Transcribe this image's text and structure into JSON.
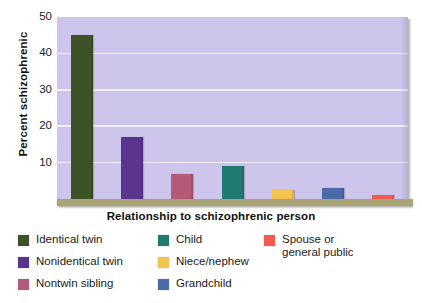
{
  "chart_data": {
    "type": "bar",
    "title": "",
    "xlabel": "Relationship to schizophrenic person",
    "ylabel": "Percent schizophrenic",
    "categories": [
      "Identical twin",
      "Nonidentical twin",
      "Nontwin sibling",
      "Child",
      "Niece/nephew",
      "Grandchild",
      "Spouse or general public"
    ],
    "values": [
      45,
      17,
      7,
      9,
      2.5,
      3,
      1
    ],
    "colors": [
      "#3d5226",
      "#5b3490",
      "#b25a77",
      "#1f7a72",
      "#f5c44e",
      "#4a6ba8",
      "#f45a4e"
    ],
    "ylim": [
      0,
      50
    ],
    "yticks": [
      10,
      20,
      30,
      40,
      50
    ],
    "ytick_labels": [
      "10",
      "20",
      "30",
      "40",
      "50"
    ],
    "grid": true,
    "legend_position": "bottom",
    "plot_background": "#cdc5ec",
    "gridline_color": "#f2f0fb",
    "floor_color": "#a9a476"
  },
  "axes": {
    "y_title": "Percent schizophrenic",
    "x_title": "Relationship to schizophrenic person",
    "ticks": [
      {
        "label": "50"
      },
      {
        "label": "40"
      },
      {
        "label": "30"
      },
      {
        "label": "20"
      },
      {
        "label": "10"
      }
    ]
  },
  "legend": {
    "columns": [
      {
        "items": [
          {
            "label": "Identical twin",
            "color": "#3d5226"
          },
          {
            "label": "Nonidentical twin",
            "color": "#5b3490"
          },
          {
            "label": "Nontwin sibling",
            "color": "#b25a77"
          }
        ]
      },
      {
        "items": [
          {
            "label": "Child",
            "color": "#1f7a72"
          },
          {
            "label": "Niece/nephew",
            "color": "#f5c44e"
          },
          {
            "label": "Grandchild",
            "color": "#4a6ba8"
          }
        ]
      },
      {
        "items": [
          {
            "label": "Spouse or\ngeneral public",
            "color": "#f45a4e"
          }
        ]
      }
    ]
  }
}
